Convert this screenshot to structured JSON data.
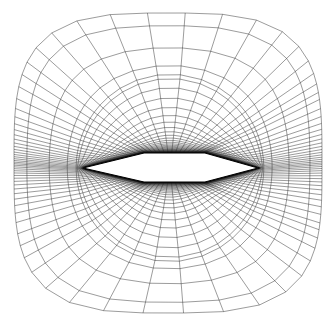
{
  "figure": {
    "title": "",
    "caption": "",
    "kind": "computational-mesh",
    "background_color": "#ffffff",
    "line_color": "#111111",
    "body_fill_color": "#ffffff",
    "width_px": 336,
    "height_px": 330
  },
  "chart_data": {
    "type": "mesh",
    "title": "",
    "subtitle": "",
    "xlabel": "",
    "ylabel": "",
    "grid": true,
    "legend": "none",
    "topology": "O-grid",
    "streamwise_lines": 97,
    "normal_lines": 49,
    "stretching": "geometric clustering toward the wall",
    "wall_spacing_ratio": 0.0018,
    "normal_growth_rate": 1.17,
    "domain": {
      "x_min": 14,
      "x_max": 322,
      "y_min": 13,
      "y_max": 313,
      "corner_round_fraction": 0.34
    },
    "body": {
      "shape": "diamond-airfoil",
      "leading_edge": [
        83,
        168
      ],
      "trailing_edge": [
        258,
        168
      ],
      "upper_crest": [
        144,
        153
      ],
      "upper_crest_aft": [
        205,
        153
      ],
      "lower_crest": [
        144,
        182
      ],
      "lower_crest_aft": [
        205,
        182
      ],
      "chord_px": 175,
      "max_thickness_px": 29,
      "thickness_ratio": 0.166,
      "crest_chord_fractions": [
        0.35,
        0.7
      ]
    },
    "center": [
      170,
      168
    ],
    "axis_ranges": {
      "x": [
        14,
        322
      ],
      "y": [
        13,
        313
      ]
    },
    "tick_labels": {
      "x": [],
      "y": []
    }
  }
}
